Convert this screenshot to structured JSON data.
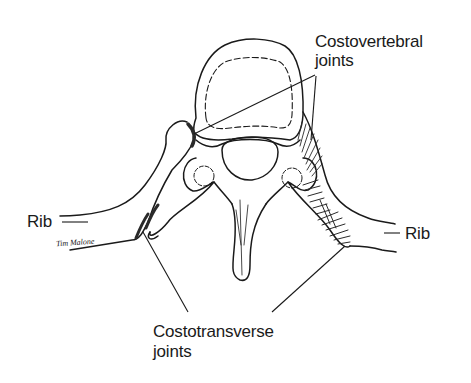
{
  "diagram": {
    "type": "anatomical line drawing",
    "labels": {
      "costovertebral": {
        "line1": "Costovertebral",
        "line2": "joints"
      },
      "costotransverse": {
        "line1": "Costotransverse",
        "line2": "joints"
      },
      "rib_left": "Rib",
      "rib_right": "Rib"
    },
    "signature": "Tim Malone",
    "colors": {
      "ink": "#1a1a1a",
      "background": "#ffffff",
      "hatching": "#2a2a2a"
    }
  }
}
